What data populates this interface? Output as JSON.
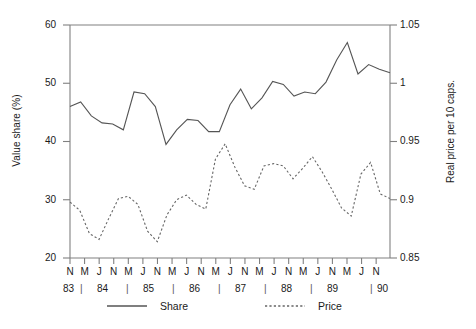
{
  "chart_data": {
    "type": "line",
    "title": "",
    "xlabel": "",
    "ylabel": "Value share (%)",
    "ylabel_secondary": "Real price per 10 caps.",
    "ylim": [
      20,
      60
    ],
    "yticks": [
      "20",
      "30",
      "40",
      "50",
      "60"
    ],
    "ylim_secondary": [
      0.85,
      1.05
    ],
    "yticks_secondary": [
      "0.85",
      "0.9",
      "0.95",
      "1",
      "1.05"
    ],
    "grid": false,
    "legend_position": "below-axes",
    "x_month_labels": [
      "N",
      "M",
      "J",
      "N",
      "M",
      "J",
      "N",
      "M",
      "J",
      "N",
      "M",
      "J",
      "N",
      "M",
      "J",
      "N",
      "M",
      "J",
      "N",
      "M",
      "J",
      "N"
    ],
    "x_year_labels": [
      "83",
      "84",
      "85",
      "86",
      "87",
      "88",
      "89",
      "90"
    ],
    "series": [
      {
        "name": "Share",
        "style": "solid",
        "color": "#555555",
        "axis": "left",
        "values": [
          46.0,
          46.8,
          44.4,
          43.2,
          43.0,
          42.0,
          48.5,
          48.2,
          46.0,
          39.5,
          42.0,
          43.8,
          43.6,
          41.7,
          41.7,
          46.3,
          49.0,
          45.6,
          47.5,
          50.3,
          49.8,
          47.8,
          48.5,
          48.2,
          50.2,
          54.0,
          57.0,
          51.6,
          53.2,
          52.4,
          51.8
        ]
      },
      {
        "name": "Price",
        "style": "dotted",
        "color": "#666666",
        "axis": "right",
        "values": [
          0.898,
          0.891,
          0.871,
          0.866,
          0.884,
          0.901,
          0.903,
          0.896,
          0.873,
          0.864,
          0.887,
          0.9,
          0.904,
          0.896,
          0.892,
          0.935,
          0.948,
          0.928,
          0.912,
          0.909,
          0.929,
          0.931,
          0.929,
          0.918,
          0.927,
          0.937,
          0.924,
          0.909,
          0.893,
          0.886,
          0.922,
          0.932,
          0.905,
          0.901
        ]
      }
    ]
  },
  "legend": {
    "share_label": "Share",
    "price_label": "Price"
  },
  "axes": {
    "left_title": "Value share (%)",
    "right_title": "Real price per 10 caps."
  }
}
